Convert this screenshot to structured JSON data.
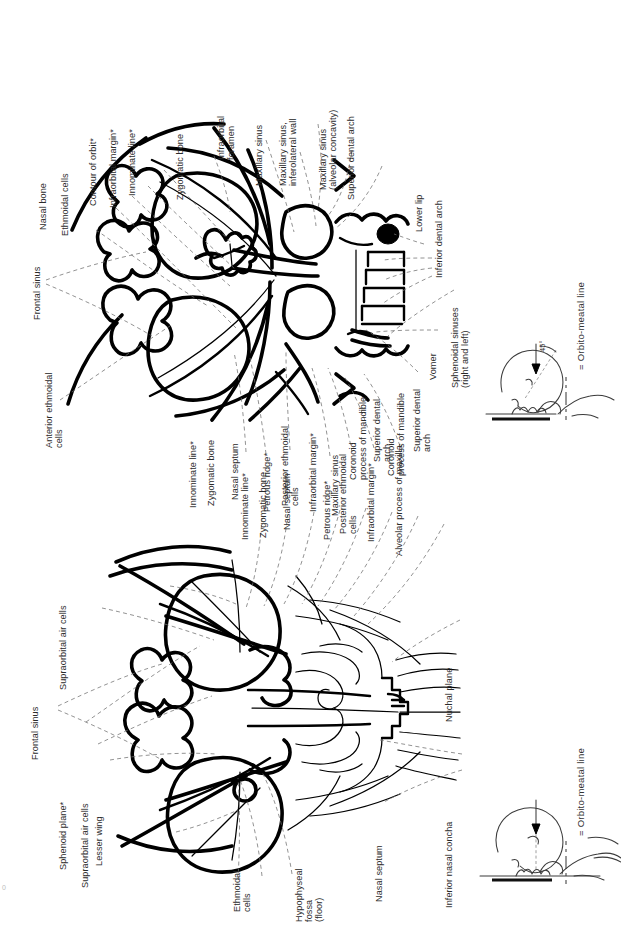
{
  "figure": {
    "type": "anatomical-radiograph-line-diagram",
    "orientation": "labels rotated 90 degrees counter-clockwise (page printed landscape)",
    "panels": [
      {
        "id": "upper",
        "name": "occipitomental-view",
        "legend": "= Orbito-meatal line",
        "legend_symbol": "—·—·—",
        "inset": {
          "name": "positioning-inset-45",
          "angle_label": "45°"
        }
      },
      {
        "id": "lower",
        "name": "occipitofrontal-view",
        "legend": "= Orbito-meatal line",
        "legend_symbol": "—·—·—",
        "inset": {
          "name": "positioning-inset-0",
          "angle_label": ""
        }
      }
    ]
  },
  "upper_labels": {
    "nasal_bone": "Nasal bone",
    "ethmoidal_cells": "Ethmoidal cells",
    "contour_of_orbit": "Contour of orbit*",
    "infraorbital_margin": "Infraorbital margin*",
    "innominate_line": "Innominate line*",
    "zygomatic_bone": "Zygomatic bone",
    "infraorbital_foramen": "Infraorbital\nforamen",
    "maxillary_sinus": "Maxillary sinus",
    "maxillary_sinus_inferolateral_wall": "Maxillary sinus,\ninferolateral wall",
    "maxillary_sinus_alveolar_concavity": "Maxillary sinus\n(alveolar concavity)",
    "superior_dental_arch_top": "Superior dental arch",
    "lower_lip": "Lower lip",
    "inferior_dental_arch": "Inferior dental arch",
    "frontal_sinus": "Frontal sinus",
    "anterior_ethmoidal_cells": "Anterior ethmoidal\ncells",
    "innominate_line_2": "Innominate line*",
    "zygomatic_bone_2": "Zygomatic bone",
    "nasal_septum": "Nasal septum",
    "petrous_ridge": "Petrous ridge*",
    "posterior_ethmoidal_cells": "Posterior ethmoidal\ncells",
    "infraorbital_margin_2": "Infraorbital margin*",
    "coronoid_process_of_mandible": "Coronoid\nprocess of mandible",
    "superior_dental_arch_2": "Superior dental\narch",
    "vomer": "Vomer",
    "sphenoidal_sinuses": "Sphenoidal sinuses\n(right and left)",
    "legend": "= Orbito-meatal line",
    "legend_symbol": "—·—·—",
    "angle": "45°"
  },
  "lower_labels": {
    "frontal_sinus": "Frontal sinus",
    "supraorbital_air_cells": "Supraorbital air cells",
    "sphenoid_plane": "Sphenoid plane*",
    "supraorbital_air_cells_2": "Supraorbital air cells",
    "lesser_wing": "Lesser wing",
    "ethmoidal_cells": "Ethmoidal\ncells",
    "hypophyseal_fossa": "Hypophyseal\nfossa\n(floor)",
    "nasal_septum_left": "Nasal septum",
    "inferior_nasal_concha": "Inferior nasal concha",
    "innominate_line": "Innominate line*",
    "zygomatic_bone": "Zygomatic bone",
    "nasal_septum": "Nasal septum",
    "petrous_ridge": "Petrous ridge*",
    "posterior_ethmoidal_cells": "Posterior ethmoidal\ncells",
    "infraorbital_margin": "Infraorbital margin*",
    "maxillary_sinus": "Maxillary sinus",
    "coronoid_process_of_mandible": "Coronoid\nprocess of mandible",
    "superior_dental_arch": "Superior dental\narch",
    "alveolar_process_of_maxilla": "Alveolar process of maxilla",
    "nuchal_plane": "Nuchal plane",
    "legend": "= Orbito-meatal line",
    "legend_symbol": "—·—·—"
  },
  "colors": {
    "ink": "#000000",
    "label_text": "#2b2b2b",
    "leader_line": "#6f6f6f",
    "background": "#ffffff"
  },
  "page_mark": "0"
}
